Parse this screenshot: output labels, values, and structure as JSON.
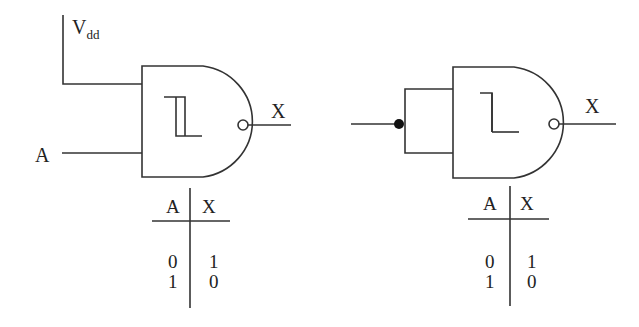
{
  "diagram": {
    "left_gate": {
      "type": "schmitt-trigger NAND",
      "supply_label": "V",
      "supply_sub": "dd",
      "input_label": "A",
      "output_label": "X"
    },
    "right_gate": {
      "type": "schmitt-trigger NAND (inputs tied)",
      "output_label": "X"
    },
    "left_table": {
      "headers": [
        "A",
        "X"
      ],
      "rows": [
        [
          "0",
          "1"
        ],
        [
          "1",
          "0"
        ]
      ]
    },
    "right_table": {
      "headers": [
        "A",
        "X"
      ],
      "rows": [
        [
          "0",
          "1"
        ],
        [
          "1",
          "0"
        ]
      ]
    },
    "colors": {
      "line": "#333333",
      "background": "#ffffff"
    }
  }
}
